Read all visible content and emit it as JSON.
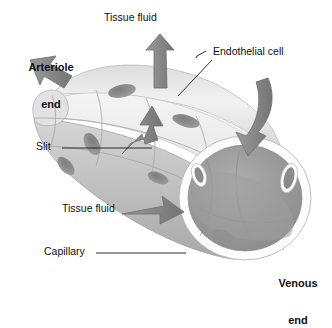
{
  "figure": {
    "background_color": "#ffffff",
    "ink_color": "#101010"
  },
  "labels": {
    "tissue_fluid_top": "Tissue fluid",
    "arteriole_end_line1": "Arteriole",
    "arteriole_end_line2": "end",
    "endothelial_cell": "Endothelial cell",
    "slit": "Slit",
    "tissue_fluid_bottom": "Tissue fluid",
    "capillary": "Capillary",
    "venous_end_line1": "Venous",
    "venous_end_line2": "end"
  },
  "palette": {
    "arrow_fill": "#8a8a8a",
    "arrow_stroke": "#6e6e6e",
    "vessel_light": "#e9e9e9",
    "vessel_mid": "#cfcfcf",
    "vessel_shadow": "#a9a9a9",
    "nucleus": "#8e8e8e",
    "lumen_dark": "#9a9a9a",
    "rim_white": "#fdfdfd",
    "leader_line": "#1a1a1a"
  },
  "structures": {
    "vessel_orientation": "upper-left to lower-right",
    "cut_end_position": "right",
    "endothelial_cell_count_visible": 6,
    "nuclei_visible": 6,
    "arrow_count": 5,
    "arrow_directions": [
      "up",
      "up-left",
      "up",
      "down-into-lumen",
      "right-into-lumen"
    ]
  }
}
